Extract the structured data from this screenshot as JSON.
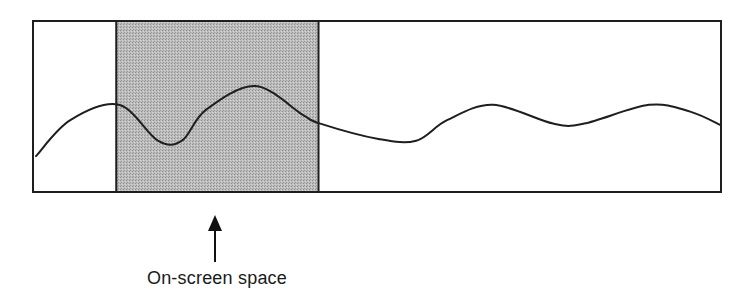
{
  "diagram": {
    "caption": "On-screen space",
    "colors": {
      "frame": "#1e1e1e",
      "curve": "#1e1e1e",
      "viewport_fill": "#b8b8b8",
      "background": "#ffffff",
      "arrow": "#111111"
    },
    "viewport": {
      "start_fraction": 0.121,
      "end_fraction": 0.415
    },
    "curve_samples_normalized": [
      [
        0.0,
        0.79
      ],
      [
        0.05,
        0.58
      ],
      [
        0.121,
        0.49
      ],
      [
        0.178,
        0.7
      ],
      [
        0.213,
        0.7
      ],
      [
        0.248,
        0.52
      ],
      [
        0.32,
        0.38
      ],
      [
        0.39,
        0.55
      ],
      [
        0.415,
        0.6
      ],
      [
        0.5,
        0.69
      ],
      [
        0.555,
        0.7
      ],
      [
        0.6,
        0.58
      ],
      [
        0.667,
        0.49
      ],
      [
        0.755,
        0.6
      ],
      [
        0.8,
        0.6
      ],
      [
        0.895,
        0.49
      ],
      [
        0.955,
        0.53
      ],
      [
        1.0,
        0.61
      ]
    ],
    "arrow": {
      "points_to": "viewport",
      "direction": "up"
    }
  }
}
